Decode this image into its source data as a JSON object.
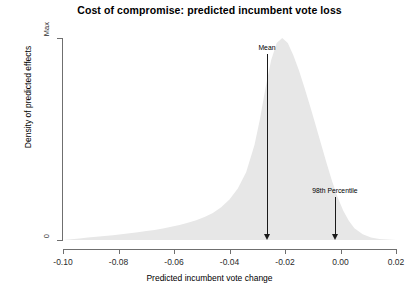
{
  "chart_data": {
    "type": "area",
    "title": "Cost of compromise: predicted incumbent vote loss",
    "xlabel": "Predicted incumbent vote change",
    "ylabel": "Density of predicted effects",
    "xlim": [
      -0.1,
      0.02
    ],
    "ylim": [
      0,
      1
    ],
    "grid": false,
    "legend": false,
    "x_ticks": [
      -0.1,
      -0.08,
      -0.06,
      -0.04,
      -0.02,
      0.0,
      0.02
    ],
    "x_tick_labels": [
      "-0.10",
      "-0.08",
      "-0.06",
      "-0.04",
      "-0.02",
      "0.00",
      "0.02"
    ],
    "y_ticks": [
      0,
      1
    ],
    "y_tick_labels": [
      "0",
      "Max"
    ],
    "fill_color": "#e7e7e7",
    "series": [
      {
        "name": "Density of predicted effects",
        "x": [
          -0.1,
          -0.097,
          -0.094,
          -0.091,
          -0.088,
          -0.085,
          -0.082,
          -0.079,
          -0.076,
          -0.073,
          -0.07,
          -0.067,
          -0.064,
          -0.061,
          -0.058,
          -0.055,
          -0.052,
          -0.049,
          -0.046,
          -0.043,
          -0.04,
          -0.037,
          -0.034,
          -0.031,
          -0.029,
          -0.027,
          -0.025,
          -0.023,
          -0.021,
          -0.019,
          -0.017,
          -0.015,
          -0.013,
          -0.011,
          -0.009,
          -0.007,
          -0.005,
          -0.003,
          -0.001,
          0.001,
          0.003,
          0.005,
          0.008,
          0.011,
          0.014,
          0.017,
          0.02
        ],
        "values": [
          0.0,
          0.004,
          0.008,
          0.012,
          0.016,
          0.02,
          0.024,
          0.028,
          0.033,
          0.038,
          0.044,
          0.05,
          0.057,
          0.065,
          0.074,
          0.085,
          0.098,
          0.114,
          0.134,
          0.162,
          0.2,
          0.255,
          0.335,
          0.47,
          0.6,
          0.755,
          0.89,
          0.975,
          1.0,
          0.975,
          0.915,
          0.84,
          0.755,
          0.665,
          0.57,
          0.475,
          0.38,
          0.29,
          0.21,
          0.145,
          0.095,
          0.058,
          0.028,
          0.012,
          0.005,
          0.002,
          0.0
        ]
      }
    ],
    "annotations": [
      {
        "label": "Mean",
        "x": -0.0265,
        "label_y_frac": 0.97,
        "name": "mean"
      },
      {
        "label": "98th Percentile",
        "x": -0.002,
        "label_y_frac": 0.26,
        "name": "percentile"
      }
    ]
  }
}
